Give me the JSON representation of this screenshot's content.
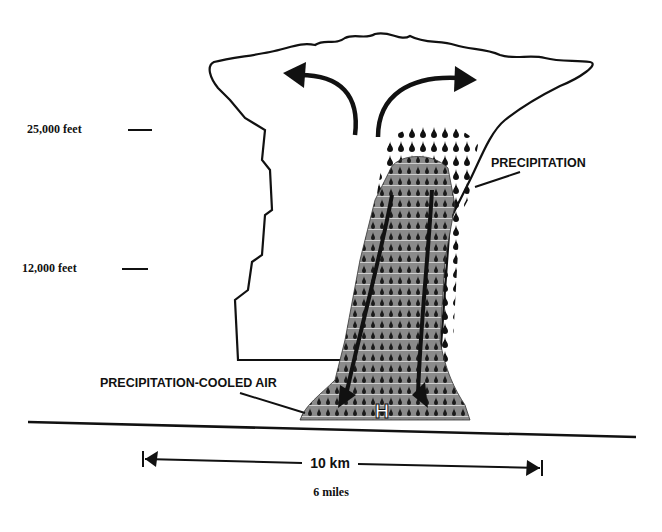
{
  "diagram": {
    "altitude_labels": [
      {
        "label": "25,000 feet"
      },
      {
        "label": "12,000 feet"
      }
    ],
    "callouts": {
      "precipitation": "PRECIPITATION",
      "cooled_air": "PRECIPITATION-COOLED AIR",
      "high_pressure": "H"
    },
    "scale": {
      "km_label": "10 km",
      "miles_label": "6 miles"
    },
    "colors": {
      "ink": "#111111",
      "shaded_core": "#8a8a8a",
      "background": "#ffffff"
    }
  }
}
